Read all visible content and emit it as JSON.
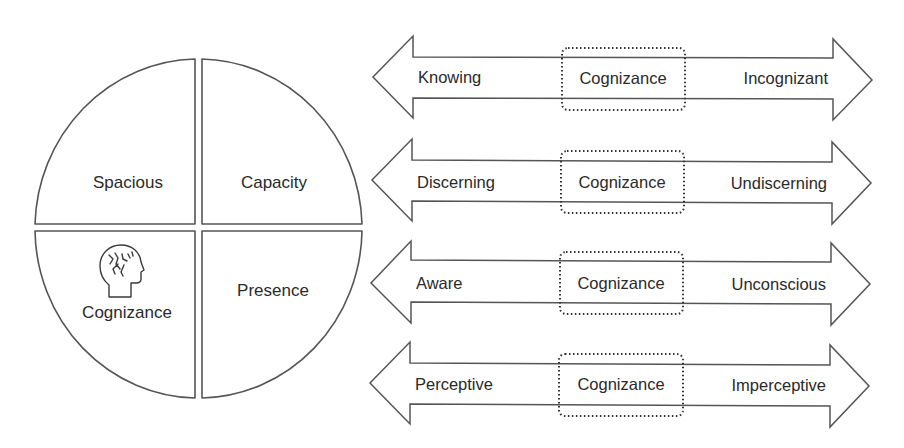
{
  "pie": {
    "quadrants": [
      {
        "id": "top-left",
        "label": "Spacious"
      },
      {
        "id": "top-right",
        "label": "Capacity"
      },
      {
        "id": "bottom-left",
        "label": "Cognizance",
        "icon": "head-brain-icon"
      },
      {
        "id": "bottom-right",
        "label": "Presence"
      }
    ]
  },
  "arrows": [
    {
      "left": "Knowing",
      "center": "Cognizance",
      "right": "Incognizant"
    },
    {
      "left": "Discerning",
      "center": "Cognizance",
      "right": "Undiscerning"
    },
    {
      "left": "Aware",
      "center": "Cognizance",
      "right": "Unconscious"
    },
    {
      "left": "Perceptive",
      "center": "Cognizance",
      "right": "Imperceptive"
    }
  ],
  "colors": {
    "stroke": "#555555",
    "text": "#2a2a2a",
    "background": "#ffffff"
  }
}
